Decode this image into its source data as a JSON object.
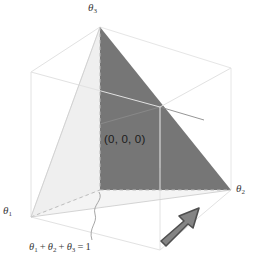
{
  "figure": {
    "width": 254,
    "height": 264,
    "background_color": "#ffffff"
  },
  "labels": {
    "axis_theta3": "θ3",
    "axis_theta3_base": "θ",
    "axis_theta3_sub": "3",
    "axis_theta2_base": "θ",
    "axis_theta2_sub": "2",
    "axis_theta1_base": "θ",
    "axis_theta1_sub": "1",
    "origin": "(0, 0, 0)",
    "constraint": {
      "t1": "θ",
      "t1_sub": "1",
      "plus_a": "+",
      "t2": "θ",
      "t2_sub": "2",
      "plus_b": "+",
      "t3": "θ",
      "t3_sub": "3",
      "equals": "=",
      "value": "1"
    }
  },
  "geometry": {
    "cube": {
      "front_bottom_left": [
        31,
        217
      ],
      "front_bottom_right": [
        160,
        250
      ],
      "front_top_left": [
        31,
        72
      ],
      "front_top_right": [
        160,
        107
      ],
      "back_bottom_left": [
        100,
        190
      ],
      "back_bottom_right": [
        231,
        190
      ],
      "back_top_left": [
        100,
        27
      ],
      "back_top_right": [
        231,
        68
      ],
      "hidden_vertex": [
        160,
        107
      ],
      "edge_color": "#e2e2e2",
      "dashed_edge_color": "#b9b9b9"
    },
    "simplex": {
      "vertex_theta3": [
        100,
        27
      ],
      "vertex_theta2": [
        231,
        190
      ],
      "vertex_theta1": [
        31,
        217
      ],
      "center_spine": [
        100,
        190
      ],
      "light_face_color": "#eeeeee",
      "dark_face_color": "#767676"
    },
    "arrow": {
      "tail": [
        161,
        238
      ],
      "head": [
        196,
        209
      ],
      "fill_color": "#808080",
      "stroke_color": "#4d4d4d"
    },
    "leader_line": {
      "color": "#9a9a9a",
      "description": "wavy squiggle from constraint label to front bottom dashed edge"
    }
  },
  "colors": {
    "text": "#2b2b2b",
    "simplex_dark": "#767676",
    "simplex_light": "#eeeeee",
    "wire": "#e2e2e2",
    "arrow": "#808080"
  }
}
